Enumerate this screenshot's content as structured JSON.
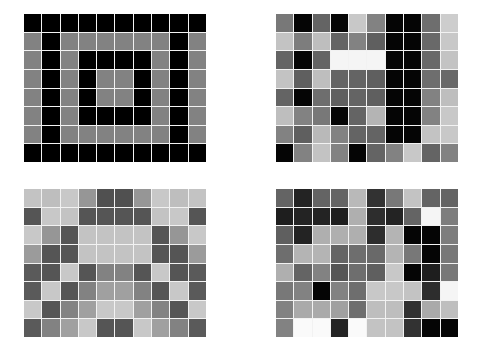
{
  "layout": {
    "rows": 8,
    "cols": 10,
    "gap_color": "#f2f2f2",
    "background": "#ffffff"
  },
  "grids": [
    {
      "name": "concentric-frames-pattern",
      "position": "top-left",
      "values": [
        [
          0,
          0,
          0,
          0,
          0,
          0,
          0,
          0,
          0,
          0
        ],
        [
          130,
          0,
          130,
          130,
          130,
          130,
          130,
          130,
          0,
          130
        ],
        [
          130,
          0,
          130,
          0,
          0,
          0,
          0,
          130,
          0,
          130
        ],
        [
          130,
          0,
          130,
          0,
          130,
          130,
          0,
          130,
          0,
          130
        ],
        [
          130,
          0,
          130,
          0,
          130,
          130,
          0,
          130,
          0,
          130
        ],
        [
          130,
          0,
          130,
          0,
          0,
          0,
          0,
          130,
          0,
          130
        ],
        [
          130,
          0,
          130,
          130,
          130,
          130,
          130,
          130,
          0,
          130
        ],
        [
          0,
          0,
          0,
          0,
          0,
          0,
          0,
          0,
          0,
          0
        ]
      ]
    },
    {
      "name": "noisy-pattern-with-dark-column",
      "position": "top-right",
      "values": [
        [
          120,
          5,
          100,
          5,
          200,
          130,
          5,
          5,
          110,
          205
        ],
        [
          195,
          125,
          190,
          100,
          130,
          95,
          5,
          5,
          105,
          200
        ],
        [
          100,
          5,
          100,
          245,
          245,
          245,
          5,
          5,
          105,
          195
        ],
        [
          195,
          95,
          190,
          100,
          100,
          95,
          5,
          5,
          110,
          105
        ],
        [
          100,
          5,
          110,
          95,
          100,
          95,
          5,
          5,
          130,
          190
        ],
        [
          190,
          130,
          120,
          5,
          100,
          180,
          5,
          5,
          130,
          200
        ],
        [
          130,
          95,
          185,
          130,
          100,
          100,
          5,
          5,
          195,
          200
        ],
        [
          5,
          130,
          195,
          130,
          5,
          100,
          130,
          200,
          100,
          130
        ]
      ]
    },
    {
      "name": "symmetric-pattern",
      "position": "bottom-left",
      "values": [
        [
          195,
          190,
          200,
          150,
          80,
          80,
          150,
          200,
          190,
          195
        ],
        [
          85,
          200,
          195,
          85,
          85,
          85,
          85,
          195,
          200,
          85
        ],
        [
          200,
          150,
          85,
          195,
          195,
          195,
          195,
          85,
          150,
          200
        ],
        [
          155,
          85,
          85,
          195,
          195,
          195,
          195,
          85,
          85,
          155
        ],
        [
          90,
          85,
          200,
          85,
          130,
          130,
          85,
          200,
          85,
          90
        ],
        [
          90,
          200,
          85,
          130,
          160,
          160,
          130,
          85,
          200,
          90
        ],
        [
          200,
          85,
          130,
          160,
          200,
          200,
          160,
          130,
          85,
          200
        ],
        [
          90,
          130,
          160,
          200,
          85,
          85,
          200,
          160,
          130,
          90
        ]
      ]
    },
    {
      "name": "random-noise-pattern",
      "position": "bottom-right",
      "values": [
        [
          100,
          35,
          100,
          100,
          185,
          50,
          120,
          195,
          100,
          100
        ],
        [
          30,
          35,
          35,
          30,
          175,
          45,
          35,
          100,
          245,
          125
        ],
        [
          95,
          35,
          175,
          175,
          175,
          45,
          180,
          5,
          5,
          125
        ],
        [
          110,
          180,
          180,
          100,
          110,
          105,
          180,
          120,
          5,
          120
        ],
        [
          175,
          100,
          130,
          85,
          110,
          95,
          200,
          5,
          30,
          120
        ],
        [
          120,
          130,
          5,
          130,
          110,
          200,
          200,
          195,
          45,
          245
        ],
        [
          130,
          170,
          170,
          160,
          110,
          190,
          190,
          50,
          170,
          190
        ],
        [
          130,
          250,
          250,
          35,
          250,
          195,
          195,
          50,
          5,
          5
        ]
      ]
    }
  ]
}
